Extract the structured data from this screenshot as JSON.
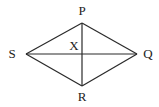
{
  "diagram": {
    "type": "rhombus-with-diagonals",
    "vertices": [
      {
        "id": "P",
        "label": "P",
        "x": 82,
        "y": 23,
        "label_x": 82,
        "label_y": 15
      },
      {
        "id": "Q",
        "label": "Q",
        "x": 137,
        "y": 54,
        "label_x": 148,
        "label_y": 58
      },
      {
        "id": "R",
        "label": "R",
        "x": 82,
        "y": 86,
        "label_x": 82,
        "label_y": 101
      },
      {
        "id": "S",
        "label": "S",
        "x": 26,
        "y": 54,
        "label_x": 12,
        "label_y": 58
      }
    ],
    "intersection": {
      "id": "X",
      "label": "X",
      "x": 82,
      "y": 54,
      "label_x": 74,
      "label_y": 50
    },
    "edges": [
      [
        "P",
        "Q"
      ],
      [
        "Q",
        "R"
      ],
      [
        "R",
        "S"
      ],
      [
        "S",
        "P"
      ]
    ],
    "diagonals": [
      [
        "P",
        "R"
      ],
      [
        "S",
        "Q"
      ]
    ]
  }
}
